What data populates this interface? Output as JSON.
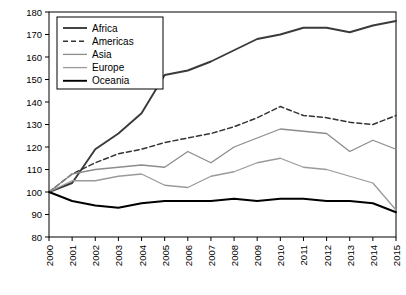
{
  "chart_data": {
    "type": "line",
    "title": "",
    "xlabel": "",
    "ylabel": "Perception index (2000=100)",
    "ylim": [
      80,
      180
    ],
    "ytick_step": 10,
    "yticks": [
      80,
      90,
      100,
      110,
      120,
      130,
      140,
      150,
      160,
      170,
      180
    ],
    "grid": false,
    "legend_position": "top-left",
    "categories": [
      "2000",
      "2001",
      "2002",
      "2003",
      "2004",
      "2005",
      "2006",
      "2007",
      "2008",
      "2009",
      "2010",
      "2011",
      "2012",
      "2013",
      "2014",
      "2015"
    ],
    "series": [
      {
        "name": "Africa",
        "style": "solid",
        "color": "#3a3a3a",
        "width": 1.9,
        "values": [
          100,
          104,
          119,
          126,
          135,
          152,
          154,
          158,
          163,
          168,
          170,
          173,
          173,
          171,
          174,
          176
        ]
      },
      {
        "name": "Americas",
        "style": "dashed",
        "color": "#333333",
        "width": 1.5,
        "values": [
          100,
          108,
          113,
          117,
          119,
          122,
          124,
          126,
          129,
          133,
          138,
          134,
          133,
          131,
          130,
          134
        ]
      },
      {
        "name": "Asia",
        "style": "solid",
        "color": "#8c8c8c",
        "width": 1.3,
        "values": [
          100,
          108,
          110,
          111,
          112,
          111,
          118,
          113,
          120,
          124,
          128,
          127,
          126,
          118,
          123,
          119
        ]
      },
      {
        "name": "Europe",
        "style": "solid",
        "color": "#9a9a9a",
        "width": 1.3,
        "values": [
          100,
          105,
          105,
          107,
          108,
          103,
          102,
          107,
          109,
          113,
          115,
          111,
          110,
          107,
          104,
          92
        ]
      },
      {
        "name": "Oceania",
        "style": "solid",
        "color": "#000000",
        "width": 1.9,
        "values": [
          100,
          96,
          94,
          93,
          95,
          96,
          96,
          96,
          97,
          96,
          97,
          97,
          96,
          96,
          95,
          91
        ]
      }
    ]
  },
  "axis": {
    "y_axis_label": "Perception index (2000=100)"
  }
}
